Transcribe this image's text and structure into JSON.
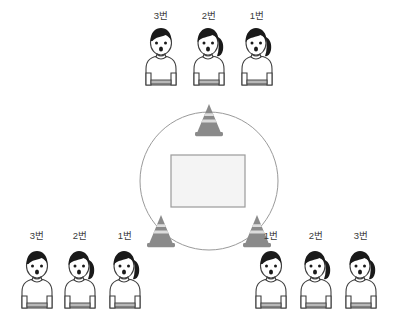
{
  "scene": {
    "title": "relay-formation-diagram",
    "background_color": "#ffffff"
  },
  "colors": {
    "outline": "#3f3f3f",
    "hair": "#1a1a1a",
    "shirt": "#ffffff",
    "shirt_hem": "#b8b8b8",
    "cone_dark": "#8a8a8a",
    "cone_light": "#d8d8d8",
    "circle_stroke": "#9a9a9a",
    "box_fill": "#f4f4f4",
    "box_stroke": "#9a9a9a",
    "label_text": "#3a3a3a"
  },
  "groups": [
    {
      "name": "top-group",
      "members": [
        {
          "label": "3번",
          "hair": "short"
        },
        {
          "label": "2번",
          "hair": "ponytail"
        },
        {
          "label": "1번",
          "hair": "ponytail"
        }
      ]
    },
    {
      "name": "bottom-left-group",
      "members": [
        {
          "label": "3번",
          "hair": "short"
        },
        {
          "label": "2번",
          "hair": "ponytail"
        },
        {
          "label": "1번",
          "hair": "ponytail"
        }
      ]
    },
    {
      "name": "bottom-right-group",
      "members": [
        {
          "label": "1번",
          "hair": "short"
        },
        {
          "label": "2번",
          "hair": "ponytail"
        },
        {
          "label": "3번",
          "hair": "ponytail"
        }
      ]
    }
  ],
  "arena": {
    "name": "circle-track",
    "cones": [
      {
        "name": "cone-top",
        "position": "top"
      },
      {
        "name": "cone-bottom-left",
        "position": "bottom-left"
      },
      {
        "name": "cone-bottom-right",
        "position": "bottom-right"
      }
    ],
    "center_box": {
      "name": "center-box"
    }
  }
}
